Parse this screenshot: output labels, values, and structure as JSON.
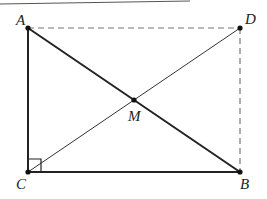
{
  "diagram": {
    "type": "geometry",
    "colors": {
      "stroke": "#222222",
      "dashed": "#777777",
      "background": "#ffffff"
    },
    "points": {
      "A": {
        "label": "A",
        "x": 28,
        "y": 28
      },
      "D": {
        "label": "D",
        "x": 240,
        "y": 28
      },
      "C": {
        "label": "C",
        "x": 28,
        "y": 172
      },
      "B": {
        "label": "B",
        "x": 240,
        "y": 172
      },
      "M": {
        "label": "M",
        "x": 134,
        "y": 100
      }
    },
    "segments": [
      {
        "from": "A",
        "to": "C",
        "style": "solid-thick"
      },
      {
        "from": "C",
        "to": "B",
        "style": "solid-thick"
      },
      {
        "from": "A",
        "to": "B",
        "style": "solid-thick"
      },
      {
        "from": "C",
        "to": "D",
        "style": "solid-thin"
      },
      {
        "from": "A",
        "to": "D",
        "style": "dashed"
      },
      {
        "from": "D",
        "to": "B",
        "style": "dashed"
      }
    ],
    "right_angle_at": "C"
  }
}
